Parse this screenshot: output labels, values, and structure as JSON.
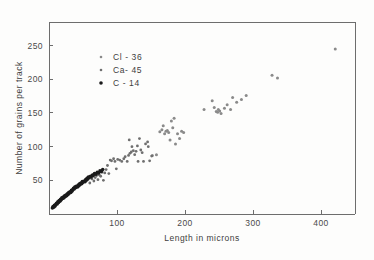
{
  "figure": {
    "background_color": "#fdfdfc",
    "frame_color": "#6d6d6d"
  },
  "chart_data": {
    "type": "scatter",
    "title": "",
    "xlabel": "Length in microns",
    "ylabel": "Number of grains per track",
    "xlim": [
      0,
      450
    ],
    "ylim": [
      0,
      285
    ],
    "xticks": [
      100,
      200,
      300,
      400
    ],
    "xtick_labels": [
      "100",
      "200",
      "300",
      "400"
    ],
    "yticks": [
      50,
      100,
      150,
      200,
      250
    ],
    "ytick_labels": [
      "50",
      "100",
      "150",
      "200",
      "250"
    ],
    "grid": false,
    "legend_position": "upper-left-inset",
    "series": [
      {
        "name": "Cl - 36",
        "marker": "dot",
        "color": "#8a8a8a",
        "size": 1.5,
        "points": [
          [
            152,
            87
          ],
          [
            158,
            88
          ],
          [
            163,
            122
          ],
          [
            166,
            125
          ],
          [
            168,
            131
          ],
          [
            170,
            119
          ],
          [
            172,
            123
          ],
          [
            174,
            124
          ],
          [
            176,
            121
          ],
          [
            178,
            110
          ],
          [
            180,
            138
          ],
          [
            182,
            128
          ],
          [
            184,
            142
          ],
          [
            186,
            104
          ],
          [
            189,
            119
          ],
          [
            192,
            112
          ],
          [
            195,
            123
          ],
          [
            198,
            121
          ],
          [
            228,
            155
          ],
          [
            240,
            168
          ],
          [
            243,
            158
          ],
          [
            246,
            152
          ],
          [
            248,
            151
          ],
          [
            249,
            155
          ],
          [
            251,
            153
          ],
          [
            253,
            149
          ],
          [
            258,
            157
          ],
          [
            262,
            162
          ],
          [
            267,
            155
          ],
          [
            270,
            173
          ],
          [
            276,
            166
          ],
          [
            283,
            170
          ],
          [
            290,
            176
          ],
          [
            328,
            206
          ],
          [
            336,
            202
          ],
          [
            421,
            245
          ]
        ]
      },
      {
        "name": "Ca- 45",
        "marker": "dot",
        "color": "#6f6f6f",
        "size": 1.4,
        "points": [
          [
            60,
            46
          ],
          [
            63,
            52
          ],
          [
            66,
            49
          ],
          [
            68,
            54
          ],
          [
            70,
            57
          ],
          [
            72,
            51
          ],
          [
            74,
            58
          ],
          [
            76,
            56
          ],
          [
            78,
            62
          ],
          [
            80,
            50
          ],
          [
            82,
            61
          ],
          [
            84,
            66
          ],
          [
            86,
            72
          ],
          [
            88,
            60
          ],
          [
            90,
            80
          ],
          [
            92,
            79
          ],
          [
            95,
            82
          ],
          [
            97,
            78
          ],
          [
            99,
            67
          ],
          [
            101,
            81
          ],
          [
            104,
            80
          ],
          [
            107,
            78
          ],
          [
            110,
            82
          ],
          [
            112,
            85
          ],
          [
            115,
            78
          ],
          [
            117,
            87
          ],
          [
            119,
            90
          ],
          [
            121,
            92
          ],
          [
            124,
            94
          ],
          [
            126,
            88
          ],
          [
            128,
            93
          ],
          [
            130,
            101
          ],
          [
            131,
            78
          ],
          [
            133,
            112
          ],
          [
            135,
            95
          ],
          [
            137,
            91
          ],
          [
            139,
            78
          ],
          [
            142,
            104
          ],
          [
            145,
            107
          ],
          [
            148,
            79
          ],
          [
            151,
            86
          ],
          [
            118,
            110
          ],
          [
            122,
            100
          ],
          [
            146,
            100
          ]
        ]
      },
      {
        "name": "C - 14",
        "marker": "dot",
        "color": "#1a1a1a",
        "size": 1.8,
        "points": [
          [
            5,
            9
          ],
          [
            6,
            11
          ],
          [
            7,
            10
          ],
          [
            8,
            13
          ],
          [
            9,
            12
          ],
          [
            10,
            14
          ],
          [
            11,
            16
          ],
          [
            12,
            15
          ],
          [
            13,
            18
          ],
          [
            14,
            17
          ],
          [
            15,
            20
          ],
          [
            16,
            19
          ],
          [
            17,
            22
          ],
          [
            18,
            21
          ],
          [
            19,
            24
          ],
          [
            20,
            23
          ],
          [
            21,
            25
          ],
          [
            22,
            24
          ],
          [
            23,
            27
          ],
          [
            24,
            26
          ],
          [
            25,
            28
          ],
          [
            26,
            27
          ],
          [
            27,
            30
          ],
          [
            28,
            29
          ],
          [
            29,
            32
          ],
          [
            30,
            31
          ],
          [
            31,
            33
          ],
          [
            32,
            32
          ],
          [
            33,
            35
          ],
          [
            34,
            34
          ],
          [
            35,
            36
          ],
          [
            36,
            38
          ],
          [
            37,
            37
          ],
          [
            38,
            40
          ],
          [
            39,
            39
          ],
          [
            40,
            41
          ],
          [
            42,
            40
          ],
          [
            43,
            43
          ],
          [
            44,
            42
          ],
          [
            45,
            45
          ],
          [
            46,
            44
          ],
          [
            47,
            46
          ],
          [
            48,
            45
          ],
          [
            49,
            48
          ],
          [
            50,
            47
          ],
          [
            52,
            49
          ],
          [
            53,
            48
          ],
          [
            54,
            51
          ],
          [
            55,
            50
          ],
          [
            56,
            53
          ],
          [
            57,
            52
          ],
          [
            58,
            55
          ],
          [
            59,
            54
          ],
          [
            61,
            56
          ],
          [
            62,
            55
          ],
          [
            64,
            58
          ],
          [
            65,
            57
          ],
          [
            67,
            60
          ],
          [
            69,
            59
          ],
          [
            71,
            62
          ],
          [
            73,
            61
          ],
          [
            75,
            64
          ],
          [
            77,
            63
          ],
          [
            79,
            66
          ]
        ]
      }
    ]
  },
  "legend": {
    "entries": [
      {
        "label": "Cl - 36",
        "marker_class": "legend-dot-cl36",
        "radius": 1.3
      },
      {
        "label": "Ca- 45",
        "marker_class": "legend-dot-ca45",
        "radius": 1.3
      },
      {
        "label": "C - 14",
        "marker_class": "legend-dot-c14",
        "radius": 1.8
      }
    ]
  }
}
